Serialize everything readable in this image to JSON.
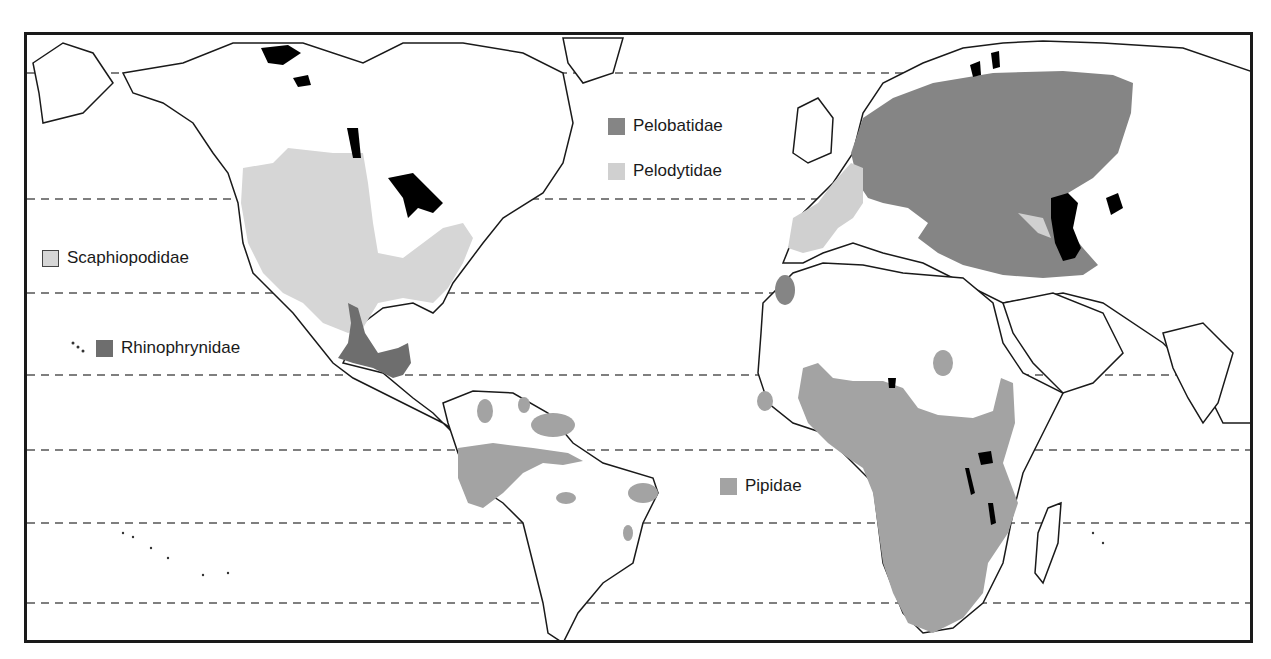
{
  "map": {
    "title": "",
    "latitude_lines": 7,
    "colors": {
      "pelobatidae": "#858585",
      "pelodytidae": "#d0d0d0",
      "scaphiopodidae": "#d6d6d6",
      "rhinophrynidae": "#6e6e6e",
      "pipidae": "#a3a3a3",
      "water": "#000000",
      "coastline": "#1a1a1a",
      "graticule": "#555555"
    }
  },
  "legend": {
    "pelobatidae": "Pelobatidae",
    "pelodytidae": "Pelodytidae",
    "scaphiopodidae": "Scaphiopodidae",
    "rhinophrynidae": "Rhinophrynidae",
    "pipidae": "Pipidae"
  }
}
